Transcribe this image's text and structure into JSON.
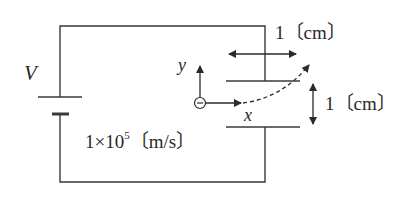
{
  "diagram": {
    "type": "circuit-with-parallel-plates",
    "labels": {
      "voltage": "V",
      "y_axis": "y",
      "x_axis": "x",
      "plate_length": "1〔cm〕",
      "plate_gap": "1〔cm〕",
      "velocity_mantissa": "1×10",
      "velocity_exponent": "5",
      "velocity_unit": "〔m/s〕"
    },
    "elements": {
      "battery": "battery-symbol",
      "upper_plate": "parallel-plate-top",
      "lower_plate": "parallel-plate-bottom",
      "electron": "electron-negative-charge",
      "electron_symbol": "−",
      "trajectory": "dashed-curved-path"
    },
    "colors": {
      "line": "#3a3a3a",
      "text": "#2a2a2a",
      "background": "#ffffff"
    }
  }
}
